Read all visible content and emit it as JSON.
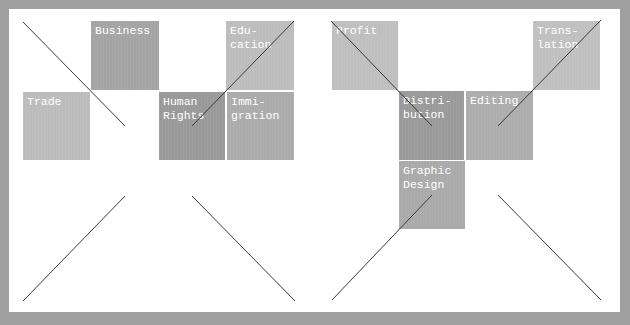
{
  "diagram": {
    "left_group": {
      "boxes": [
        {
          "label": "Business",
          "x": 91,
          "y": 21,
          "w": 68,
          "h": 69,
          "color": "#a4a4a4"
        },
        {
          "label": "Edu-\ncation",
          "x": 226,
          "y": 21,
          "w": 68,
          "h": 69,
          "color": "#bdbdbd"
        },
        {
          "label": "Trade",
          "x": 23,
          "y": 92,
          "w": 67,
          "h": 68,
          "color": "#bcbcbc"
        },
        {
          "label": "Human\nRights",
          "x": 159,
          "y": 92,
          "w": 66,
          "h": 68,
          "color": "#999999"
        },
        {
          "label": "Immi-\ngration",
          "x": 227,
          "y": 92,
          "w": 67,
          "h": 68,
          "color": "#ababab"
        }
      ]
    },
    "right_group": {
      "boxes": [
        {
          "label": "Profit",
          "x": 332,
          "y": 21,
          "w": 66,
          "h": 69,
          "color": "#bfbfbf"
        },
        {
          "label": "Trans-\nlation",
          "x": 533,
          "y": 21,
          "w": 67,
          "h": 69,
          "color": "#c0c0c0"
        },
        {
          "label": "Distri-\nbution",
          "x": 399,
          "y": 91,
          "w": 65,
          "h": 69,
          "color": "#9a9a9a"
        },
        {
          "label": "Editing",
          "x": 466,
          "y": 91,
          "w": 67,
          "h": 69,
          "color": "#adadad"
        },
        {
          "label": "Graphic\nDesign",
          "x": 399,
          "y": 161,
          "w": 66,
          "h": 68,
          "color": "#aaaaaa"
        }
      ]
    },
    "colors": {
      "frame": "#9f9f9f",
      "panel": "#ffffff",
      "line": "#3a3a3a",
      "label": "#ffffff"
    }
  }
}
